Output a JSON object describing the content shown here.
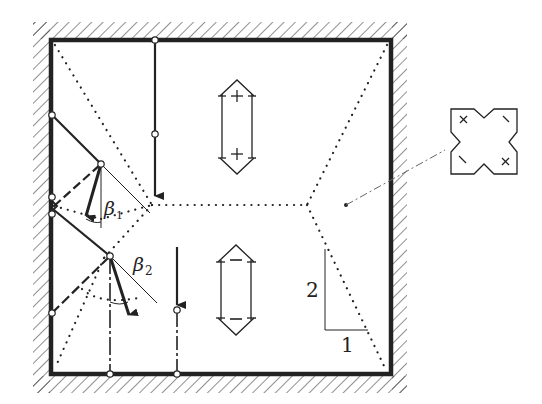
{
  "diagram": {
    "colors": {
      "ink": "#222222",
      "background": "#ffffff"
    },
    "labels": {
      "beta1": "β",
      "beta1_sub": "1",
      "beta2": "β",
      "beta2_sub": "2",
      "slope_rise": "2",
      "slope_run": "1",
      "positive_sign": "+",
      "negative_sign": "−"
    },
    "regions": {
      "positive_moment_symbol": [
        "+",
        "+"
      ],
      "negative_moment_symbol": [
        "−",
        "−"
      ]
    },
    "legend": {
      "symbol": "fixed-corner-cross-icon",
      "marks": [
        "×",
        "\\",
        "\\",
        "×"
      ]
    },
    "slope_indicator": {
      "rise": 2,
      "run": 1
    }
  }
}
